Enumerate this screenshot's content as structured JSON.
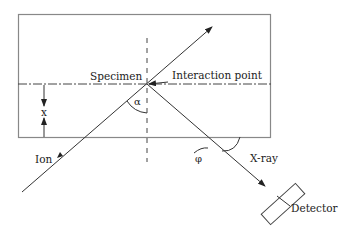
{
  "diagram": {
    "type": "schematic",
    "labels": {
      "specimen": "Specimen",
      "interaction_point": "Interaction point",
      "depth": "x",
      "incidence_angle": "α",
      "takeoff_angle": "φ",
      "ion": "Ion",
      "xray": "X-ray",
      "detector": "Detector"
    },
    "elements": [
      {
        "id": "specimen-box",
        "kind": "rectangle"
      },
      {
        "id": "surface-line",
        "kind": "dash-dot line"
      },
      {
        "id": "normal-line",
        "kind": "dashed line"
      },
      {
        "id": "ion-path",
        "kind": "arrow line"
      },
      {
        "id": "xray-path",
        "kind": "arrow line"
      },
      {
        "id": "detector",
        "kind": "rotated rectangle"
      }
    ],
    "colors": {
      "stroke": "#333333",
      "box_stroke": "#888888",
      "text": "#222222"
    }
  }
}
